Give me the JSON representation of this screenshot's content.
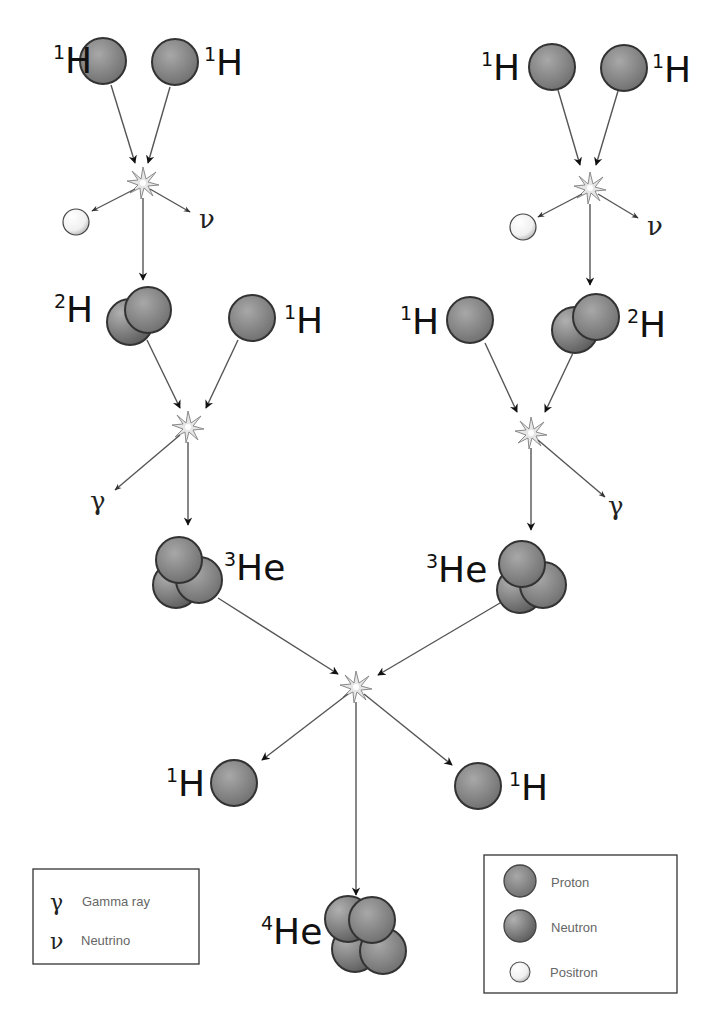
{
  "colors": {
    "proton": "#8a8a8a",
    "neutron": "#7a7a7a",
    "positron": "#f4f4f4",
    "outline": "#333333",
    "arrow": "#555555",
    "star": "#d8d8d8"
  },
  "nuclei": {
    "h1_top_left_a": {
      "mass": "1",
      "symbol": "H"
    },
    "h1_top_left_b": {
      "mass": "1",
      "symbol": "H"
    },
    "h1_top_right_a": {
      "mass": "1",
      "symbol": "H"
    },
    "h1_top_right_b": {
      "mass": "1",
      "symbol": "H"
    },
    "h2_left": {
      "mass": "2",
      "symbol": "H"
    },
    "h1_mid_left": {
      "mass": "1",
      "symbol": "H"
    },
    "h1_mid_right": {
      "mass": "1",
      "symbol": "H"
    },
    "h2_right": {
      "mass": "2",
      "symbol": "H"
    },
    "he3_left": {
      "mass": "3",
      "symbol": "He"
    },
    "he3_right": {
      "mass": "3",
      "symbol": "He"
    },
    "h1_bottom_left": {
      "mass": "1",
      "symbol": "H"
    },
    "h1_bottom_right": {
      "mass": "1",
      "symbol": "H"
    },
    "he4": {
      "mass": "4",
      "symbol": "He"
    }
  },
  "emissions": {
    "neutrino_left": "ν",
    "neutrino_right": "ν",
    "gamma_left": "γ",
    "gamma_right": "γ"
  },
  "legend_symbols": {
    "items": [
      {
        "symbol": "γ",
        "label": "Gamma ray"
      },
      {
        "symbol": "ν",
        "label": "Neutrino"
      }
    ]
  },
  "legend_particles": {
    "items": [
      {
        "icon": "proton-icon",
        "label": "Proton"
      },
      {
        "icon": "neutron-icon",
        "label": "Neutron"
      },
      {
        "icon": "positron-icon",
        "label": "Positron"
      }
    ]
  }
}
